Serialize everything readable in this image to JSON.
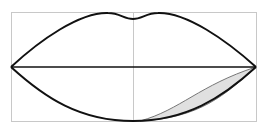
{
  "diagram": {
    "colors": {
      "background": "#ffffff",
      "frame": "#c8c8c8",
      "guide_line": "#c8c8c8",
      "outline": "#111111",
      "shading_fill": "#e0e0e0",
      "shading_stroke": "#777777"
    },
    "elements": [
      "bounding-frame",
      "vertical-center-guide",
      "upper-lip-outline",
      "lip-parting-line",
      "lower-lip-outline",
      "lower-lip-shading"
    ]
  }
}
